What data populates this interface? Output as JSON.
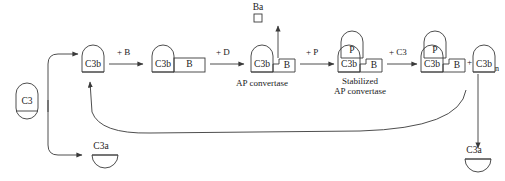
{
  "diagram": {
    "stroke_color": "#3a3a3a",
    "text_color": "#1a1a1a",
    "background_color": "#ffffff"
  },
  "nodes": {
    "c3": {
      "label": "C3",
      "shape": "capsule"
    },
    "c3b_initial": {
      "label": "C3b",
      "shape": "domed-box"
    },
    "c3b_b": {
      "label": "C3b",
      "partner": "B",
      "shape": "domed-box-plus-box"
    },
    "ap_convertase": {
      "label": "C3b",
      "partner": "B",
      "caption": "AP convertase"
    },
    "stabilized": {
      "label": "C3b",
      "partner": "B",
      "properdin": "P",
      "caption_line1": "Stabilized",
      "caption_line2": "AP convertase"
    },
    "product_complex": {
      "label": "C3b",
      "partner": "B",
      "properdin": "P"
    },
    "c3b_n": {
      "label": "C3b",
      "subscript": "n",
      "shape": "domed-box"
    },
    "ba": {
      "label": "Ba",
      "shape": "small-square"
    },
    "c3a_left": {
      "label": "C3a",
      "shape": "half-disc"
    },
    "c3a_right": {
      "label": "C3a",
      "shape": "half-disc"
    }
  },
  "reactions": {
    "add_b": "+ B",
    "add_d": "+ D",
    "add_p": "+ P",
    "add_c3": "+ C3",
    "plus_sign": "+"
  }
}
